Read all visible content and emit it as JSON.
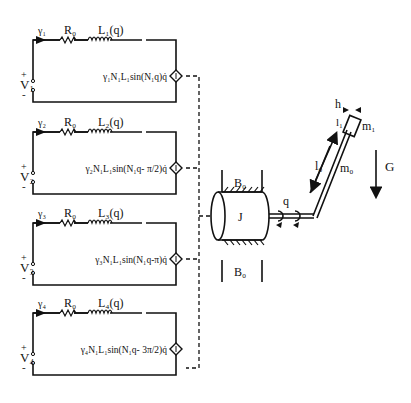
{
  "diagram": {
    "type": "circuit-electromechanical",
    "circuits": [
      {
        "id": 1,
        "current": "γ₁",
        "resistor": "R₀",
        "inductor": "L₁(q)",
        "voltage": "V₁",
        "plus": "+",
        "minus": "-",
        "source": "γ₁N₁L₁sin(N₁q)q̇",
        "y": 40
      },
      {
        "id": 2,
        "current": "γ₂",
        "resistor": "R₀",
        "inductor": "L₂(q)",
        "voltage": "V₂",
        "plus": "+",
        "minus": "-",
        "source": "γ₂N₁L₁sin(N₁q- π/2)q̇",
        "y": 132
      },
      {
        "id": 3,
        "current": "γ₃",
        "resistor": "R₀",
        "inductor": "L₃(q)",
        "voltage": "V₃",
        "plus": "+",
        "minus": "-",
        "source": "γ₃N₁L₁sin(N₁q-π)q̇",
        "y": 223
      },
      {
        "id": 4,
        "current": "γ₄",
        "resistor": "R₀",
        "inductor": "L₄(q)",
        "voltage": "V₄",
        "plus": "+",
        "minus": "-",
        "source": "γ₄N₁L₁sin(N₁q- 3π/2)q̇",
        "y": 313
      }
    ],
    "mechanism": {
      "inertia_label": "J",
      "bearing_top_label": "B₀",
      "bearing_bottom_label": "B₀",
      "angle_label": "q",
      "link_length_label": "l₀",
      "link_mass_label": "m₀",
      "tip_length_label": "l₁",
      "tip_offset_label": "h",
      "tip_mass_label": "m₁",
      "gravity_label": "G"
    }
  }
}
